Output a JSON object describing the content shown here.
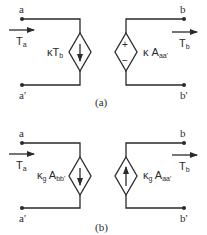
{
  "figure": {
    "panels": [
      {
        "caption": "(a)",
        "terminals": {
          "top_left": "a",
          "bottom_left": "a'",
          "top_right": "b",
          "bottom_right": "b'"
        },
        "left_arrow": {
          "symbol": "T",
          "sub": "a"
        },
        "right_arrow": {
          "symbol": "T",
          "sub": "b"
        },
        "left_source": {
          "type": "dependent current source",
          "direction": "down",
          "label_main": "κT",
          "label_sub": "b"
        },
        "right_source": {
          "type": "dependent voltage source",
          "plus": "+",
          "minus": "−",
          "label_main": "κ A",
          "label_sub": "aa'"
        }
      },
      {
        "caption": "(b)",
        "terminals": {
          "top_left": "a",
          "bottom_left": "a'",
          "top_right": "b",
          "bottom_right": "b'"
        },
        "left_arrow": {
          "symbol": "T",
          "sub": "a"
        },
        "right_arrow": {
          "symbol": "T",
          "sub": "b"
        },
        "left_source": {
          "type": "dependent current source",
          "direction": "down",
          "label_main": "κ",
          "label_gsub": "g",
          "label_main2": " A",
          "label_sub": "bb'"
        },
        "right_source": {
          "type": "dependent current source",
          "direction": "up",
          "label_main": "κ",
          "label_gsub": "g",
          "label_main2": " A",
          "label_sub": "aa'"
        }
      }
    ]
  }
}
